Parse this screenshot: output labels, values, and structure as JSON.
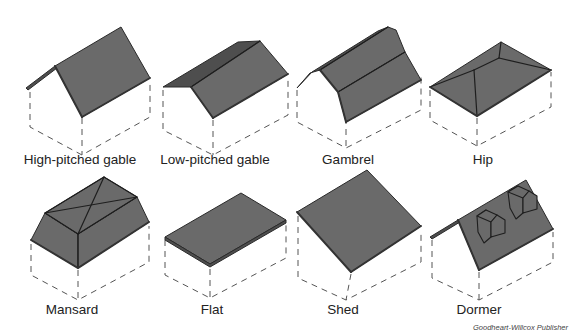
{
  "figure": {
    "credit": "Goodheart-Willcox Publisher",
    "roof_fill_color": "#6a6a6a",
    "outline_color": "#2a2a2a",
    "hidden_line_style": "dashed"
  },
  "roofs": [
    {
      "id": "high-pitched-gable",
      "label": "High-pitched gable",
      "row": 1,
      "column": 1
    },
    {
      "id": "low-pitched-gable",
      "label": "Low-pitched gable",
      "row": 1,
      "column": 2
    },
    {
      "id": "gambrel",
      "label": "Gambrel",
      "row": 1,
      "column": 3
    },
    {
      "id": "hip",
      "label": "Hip",
      "row": 1,
      "column": 4
    },
    {
      "id": "mansard",
      "label": "Mansard",
      "row": 2,
      "column": 1
    },
    {
      "id": "flat",
      "label": "Flat",
      "row": 2,
      "column": 2
    },
    {
      "id": "shed",
      "label": "Shed",
      "row": 2,
      "column": 3
    },
    {
      "id": "dormer",
      "label": "Dormer",
      "row": 2,
      "column": 4
    }
  ]
}
